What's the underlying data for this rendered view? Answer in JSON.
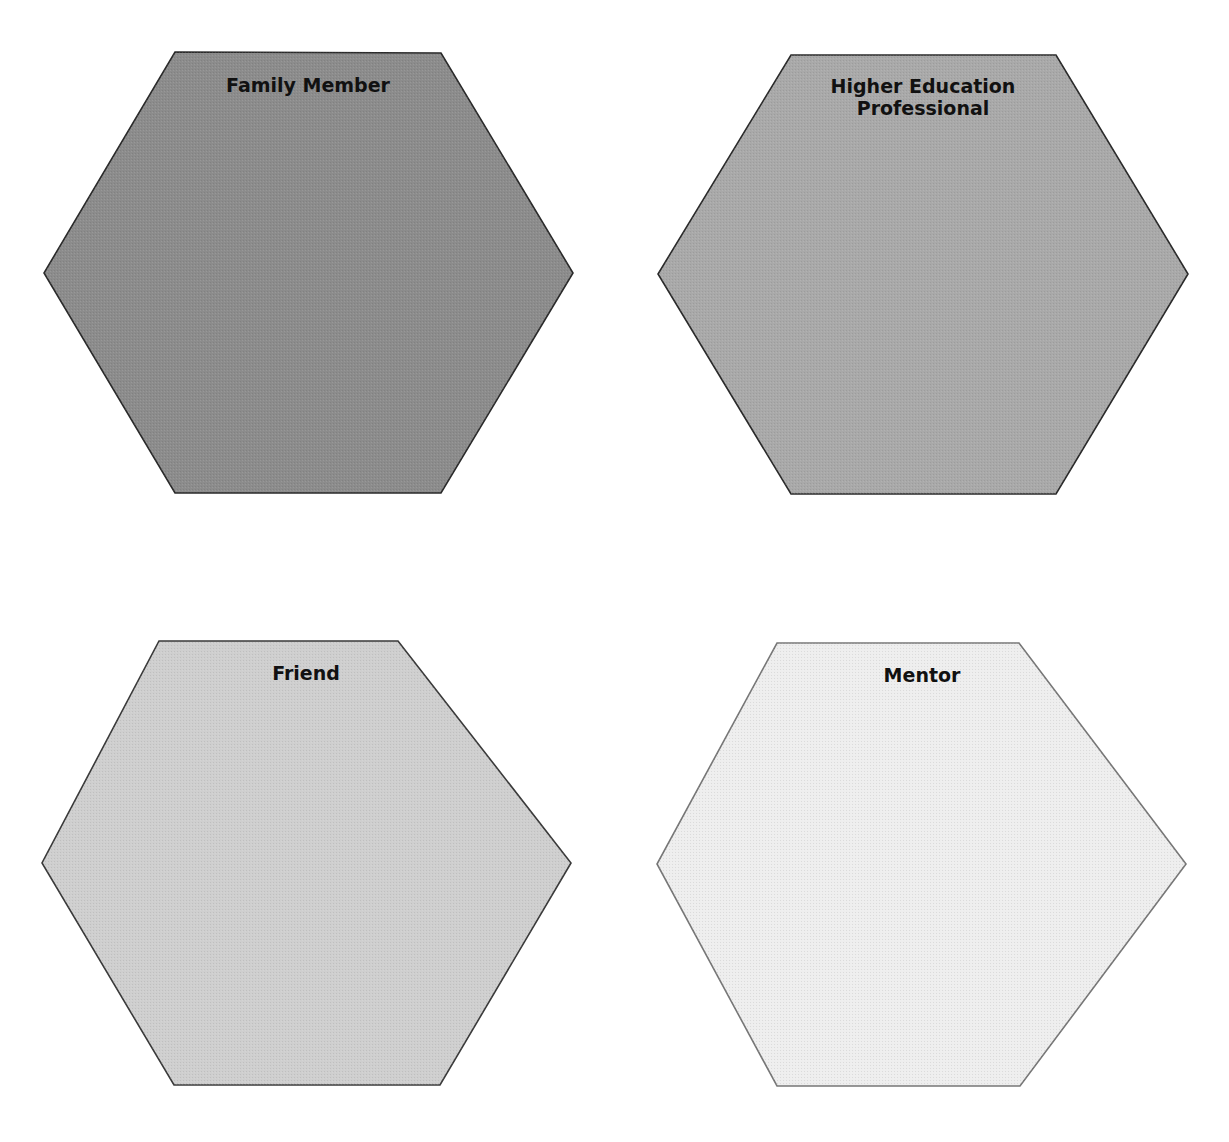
{
  "diagram": {
    "type": "hexagon-grid",
    "rows": 2,
    "columns": 2,
    "hexagons": [
      {
        "id": "family-member",
        "label": "Family Member",
        "fill": "#8c8c8c",
        "stroke": "#2a2a2a",
        "points": [
          [
            175,
            52
          ],
          [
            441,
            53
          ],
          [
            573,
            273
          ],
          [
            441,
            493
          ],
          [
            175,
            493
          ],
          [
            44,
            273
          ]
        ],
        "label_x": 308,
        "label_y": 74
      },
      {
        "id": "higher-education-professional",
        "label": "Higher Education\nProfessional",
        "fill": "#a9a9a9",
        "stroke": "#2a2a2a",
        "points": [
          [
            791,
            55
          ],
          [
            1056,
            55
          ],
          [
            1188,
            274
          ],
          [
            1056,
            494
          ],
          [
            791,
            494
          ],
          [
            658,
            274
          ]
        ],
        "label_x": 923,
        "label_y": 75
      },
      {
        "id": "friend",
        "label": "Friend",
        "fill": "#cfcfcf",
        "stroke": "#3a3a3a",
        "points": [
          [
            159,
            641
          ],
          [
            398,
            641
          ],
          [
            571,
            863
          ],
          [
            440,
            1085
          ],
          [
            174,
            1085
          ],
          [
            42,
            863
          ]
        ],
        "label_x": 306,
        "label_y": 662
      },
      {
        "id": "mentor",
        "label": "Mentor",
        "fill": "#eeeeee",
        "stroke": "#777777",
        "points": [
          [
            777,
            643
          ],
          [
            1019,
            643
          ],
          [
            1186,
            864
          ],
          [
            1020,
            1086
          ],
          [
            777,
            1086
          ],
          [
            657,
            864
          ]
        ],
        "label_x": 922,
        "label_y": 664
      }
    ]
  }
}
